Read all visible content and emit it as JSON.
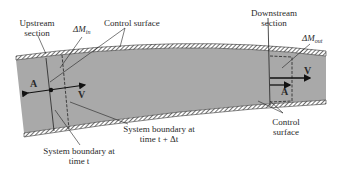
{
  "figure": {
    "type": "fluid-flow control volume diagram",
    "labels": {
      "upstream_section": [
        "Upstream",
        "section"
      ],
      "delta_m_in": {
        "symbol": "ΔM",
        "subscript": "in"
      },
      "control_surface_top": "Control surface",
      "downstream_section": [
        "Downstream",
        "section"
      ],
      "delta_m_out": {
        "symbol": "ΔM",
        "subscript": "out"
      },
      "area_left": "A",
      "velocity_left": "V",
      "area_right": "A",
      "velocity_right": "V",
      "control_surface_bottom": [
        "Control",
        "surface"
      ],
      "system_boundary_t": [
        "System boundary at",
        "time t"
      ],
      "system_boundary_t_dt": [
        "System boundary at",
        "time t + Δt"
      ]
    },
    "colors": {
      "fluid": "#a9a9a9",
      "wall": "#3a3a3a",
      "ink": "#222222",
      "background": "#ffffff"
    }
  }
}
